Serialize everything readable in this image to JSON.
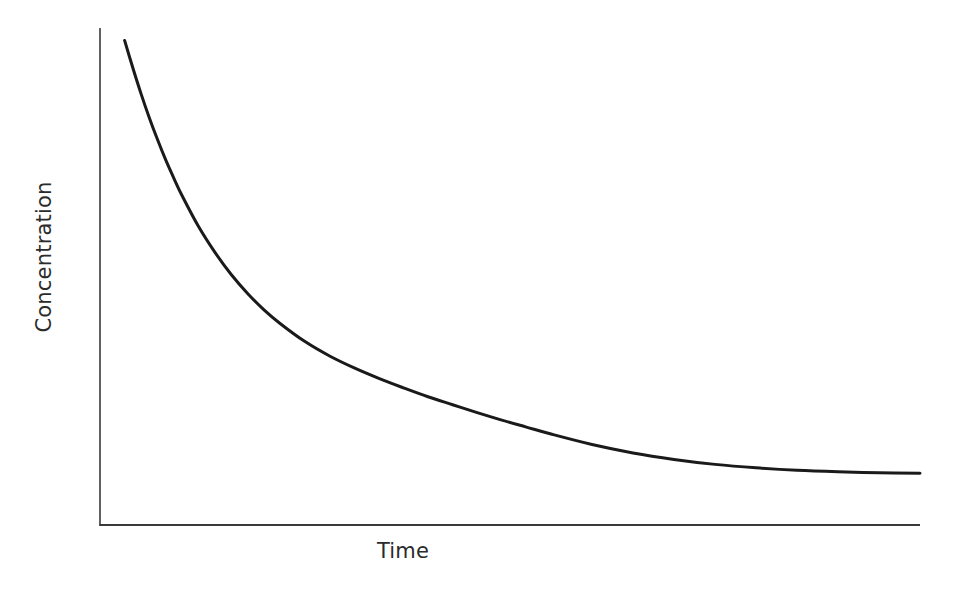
{
  "chart_data": {
    "type": "line",
    "title": "",
    "subtitle": "",
    "xlabel": "Time",
    "ylabel": "Concentration",
    "grid": false,
    "legend": null,
    "annotations": [],
    "xlim": [
      0,
      100
    ],
    "ylim": [
      0,
      100
    ],
    "xticks": [],
    "yticks": [],
    "xticklabels": [],
    "yticklabels": [],
    "series": [
      {
        "name": "Concentration decay",
        "color": "#1a1a1a",
        "linewidth": 3,
        "x": [
          3.0,
          4.0,
          5.0,
          6.0,
          7.0,
          8.0,
          9.0,
          10.0,
          12.0,
          14.0,
          16.0,
          18.0,
          20.0,
          22.0,
          25.0,
          28.0,
          31.0,
          34.0,
          37.0,
          40.0,
          43.0,
          46.0,
          49.0,
          52.0,
          55.0,
          60.0,
          65.0,
          70.0,
          75.0,
          80.0,
          85.0,
          90.0,
          95.0,
          100.0
        ],
        "y": [
          97.5,
          92.0,
          86.8,
          82.0,
          77.6,
          73.5,
          69.8,
          66.3,
          60.1,
          54.9,
          50.4,
          46.6,
          43.3,
          40.5,
          36.9,
          34.0,
          31.6,
          29.5,
          27.6,
          25.8,
          24.2,
          22.6,
          21.1,
          19.7,
          18.3,
          16.2,
          14.5,
          13.2,
          12.2,
          11.5,
          11.0,
          10.7,
          10.5,
          10.4
        ]
      }
    ],
    "plateau_value": 10.3,
    "start_value": 97.5
  },
  "labels": {
    "x_axis": "Time",
    "y_axis": "Concentration"
  },
  "style": {
    "curve_color": "#1a1a1a",
    "axis_color": "#3a3a3a",
    "text_color": "#2b2b2b",
    "background": "#ffffff"
  }
}
